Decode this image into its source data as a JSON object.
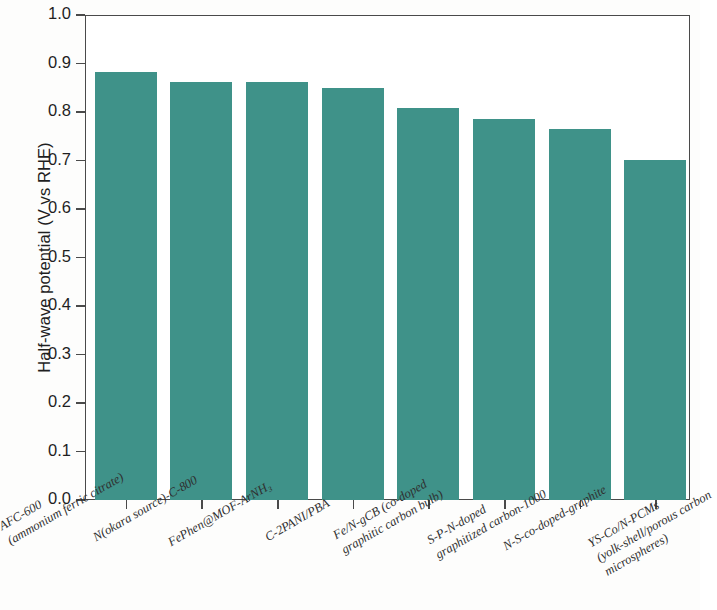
{
  "chart_data": {
    "type": "bar",
    "title": "",
    "xlabel": "",
    "ylabel": "Half-wave potential (V vs RHE)",
    "ylim": [
      0.0,
      1.0
    ],
    "ytick_labels": [
      "0.0",
      "0.1",
      "0.2",
      "0.3",
      "0.4",
      "0.5",
      "0.6",
      "0.7",
      "0.8",
      "0.9",
      "1.0"
    ],
    "ytick_values": [
      0.0,
      0.1,
      0.2,
      0.3,
      0.4,
      0.5,
      0.6,
      0.7,
      0.8,
      0.9,
      1.0
    ],
    "grid": false,
    "legend": "none",
    "bar_color": "#3f9289",
    "axis_color": "#4a4a4a",
    "categories": [
      "AFC-600 (ammonium ferric citrate)",
      "N(okara source)-C-800",
      "FePhen@MOF-ArNH₃",
      "C-2PANI/PBA",
      "Fe/N-gCB (co-doped graphitic carbon bulb)",
      "S-P-N-doped graphitized carbon-1000",
      "N-S-co-doped-graphite",
      "YS-Co/N-PCMs (yolk-shell/porous carbon microspheres)"
    ],
    "category_lines": [
      [
        "AFC-600",
        "(ammonium ferric citrate)"
      ],
      [
        "N(okara source)-C-800"
      ],
      [
        "FePhen@MOF-ArNH₃"
      ],
      [
        "C-2PANI/PBA"
      ],
      [
        "Fe/N-gCB (co-doped",
        "graphitic carbon bulb)"
      ],
      [
        "S-P-N-doped",
        "graphitized carbon-1000"
      ],
      [
        "N-S-co-doped-graphite"
      ],
      [
        "YS-Co/N-PCMs",
        "(yolk-shell/porous carbon",
        "microspheres)"
      ]
    ],
    "values": [
      0.883,
      0.861,
      0.861,
      0.85,
      0.808,
      0.786,
      0.765,
      0.702
    ]
  }
}
